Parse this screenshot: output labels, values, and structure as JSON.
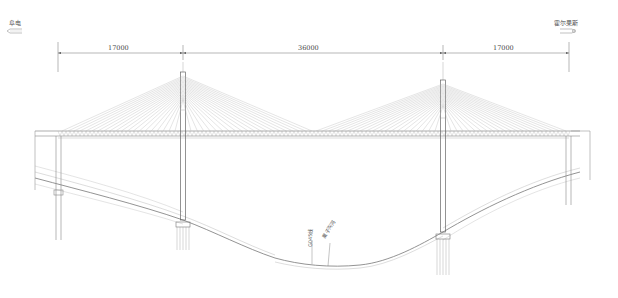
{
  "diagram": {
    "type": "cable-stayed bridge elevation",
    "directions": {
      "left": {
        "label": "阜电",
        "arrow": "left"
      },
      "right": {
        "label": "霍尔果斯",
        "arrow": "right"
      }
    },
    "dimensions": {
      "unit": "cm",
      "spans": [
        {
          "label": "17000",
          "from": "left-abutment",
          "to": "left-tower"
        },
        {
          "label": "36000",
          "from": "left-tower",
          "to": "right-tower"
        },
        {
          "label": "17000",
          "from": "right-tower",
          "to": "right-abutment"
        }
      ]
    },
    "annotations": {
      "road": "G045线",
      "river": "果子沟河"
    },
    "colors": {
      "line": "#8a8a8a",
      "cable": "#b5b5b5",
      "text": "#555555"
    }
  }
}
